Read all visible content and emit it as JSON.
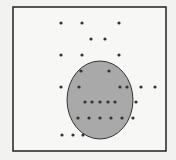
{
  "diagram": {
    "frame": {
      "x": 13,
      "y": 7,
      "width": 153,
      "height": 144,
      "stroke": "#222222",
      "fill": "#f7f7f5"
    },
    "region": {
      "cx": 100,
      "cy": 100,
      "rx": 33,
      "ry": 39,
      "fill": "#a9a9a9",
      "stroke": "#333333"
    },
    "point_color": "#333333",
    "points": [
      [
        61,
        23
      ],
      [
        82,
        23
      ],
      [
        119,
        23
      ],
      [
        91,
        39
      ],
      [
        105,
        39
      ],
      [
        61,
        55
      ],
      [
        82,
        55
      ],
      [
        119,
        55
      ],
      [
        81,
        71
      ],
      [
        109,
        71
      ],
      [
        61,
        87
      ],
      [
        79,
        87
      ],
      [
        120,
        87
      ],
      [
        127,
        87
      ],
      [
        141,
        87
      ],
      [
        155,
        87
      ],
      [
        85,
        102
      ],
      [
        92,
        102
      ],
      [
        100,
        102
      ],
      [
        108,
        102
      ],
      [
        115,
        102
      ],
      [
        136,
        102
      ],
      [
        78,
        118
      ],
      [
        89,
        118
      ],
      [
        100,
        118
      ],
      [
        111,
        118
      ],
      [
        122,
        118
      ],
      [
        133,
        118
      ],
      [
        62,
        135
      ],
      [
        73,
        135
      ],
      [
        83,
        135
      ]
    ]
  }
}
